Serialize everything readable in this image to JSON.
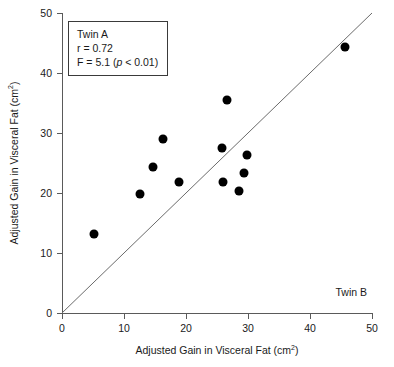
{
  "chart_data": {
    "type": "scatter",
    "title": "",
    "xlabel": "Adjusted Gain in Visceral Fat (cm2)",
    "ylabel": "Adjusted Gain in Visceral Fat (cm2)",
    "xlabel_base": "Adjusted Gain in Visceral Fat (cm",
    "xlabel_sup": "2",
    "xlabel_tail": ")",
    "xlim": [
      0,
      50
    ],
    "ylim": [
      0,
      50
    ],
    "xticks": [
      0,
      10,
      20,
      30,
      40,
      50
    ],
    "yticks": [
      0,
      10,
      20,
      30,
      40,
      50
    ],
    "xticklabels": [
      "0",
      "10",
      "20",
      "30",
      "40",
      "50"
    ],
    "yticklabels": [
      "0",
      "10",
      "20",
      "30",
      "40",
      "50"
    ],
    "grid": false,
    "legend": "none",
    "marker_color": "#000000",
    "marker_shape": "circle",
    "axis_color": "#5a5a5a",
    "reference_line": {
      "name": "identity-line",
      "from": [
        0,
        0
      ],
      "to": [
        50,
        50
      ],
      "color": "#6b6b6b",
      "width": 1
    },
    "points": [
      {
        "x": 5.2,
        "y": 13.2
      },
      {
        "x": 12.6,
        "y": 19.8
      },
      {
        "x": 14.7,
        "y": 24.3
      },
      {
        "x": 16.3,
        "y": 29.0
      },
      {
        "x": 18.8,
        "y": 21.8
      },
      {
        "x": 25.8,
        "y": 27.5
      },
      {
        "x": 26.0,
        "y": 21.8
      },
      {
        "x": 26.6,
        "y": 35.5
      },
      {
        "x": 28.5,
        "y": 20.4
      },
      {
        "x": 29.4,
        "y": 23.3
      },
      {
        "x": 29.8,
        "y": 26.3
      },
      {
        "x": 45.6,
        "y": 44.3
      }
    ],
    "annotations": [
      {
        "name": "stats-box",
        "lines": [
          "Twin A",
          "r = 0.72",
          "F = 5.1 (p < 0.01)"
        ],
        "line1": "Twin A",
        "line2": "r = 0.72",
        "line3_pre": "F = 5.1 (",
        "line3_italic": "p",
        "line3_post": " < 0.01)",
        "position": "top-left"
      },
      {
        "name": "twin-b-label",
        "text": "Twin B",
        "position": "bottom-right"
      }
    ]
  },
  "axes": {
    "x_title_base": "Adjusted Gain in Visceral Fat (cm",
    "x_title_sup": "2",
    "x_title_tail": ")",
    "y_title_base": "Adjusted Gain in Visceral Fat (cm",
    "y_title_sup": "2",
    "y_title_tail": ")"
  },
  "stats": {
    "twin_a_label": "Twin A",
    "r_value": "r = 0.72",
    "f_pre": "F = 5.1 (",
    "f_italic": "p",
    "f_post": " < 0.01)"
  },
  "corner": {
    "twin_b_label": "Twin B"
  }
}
